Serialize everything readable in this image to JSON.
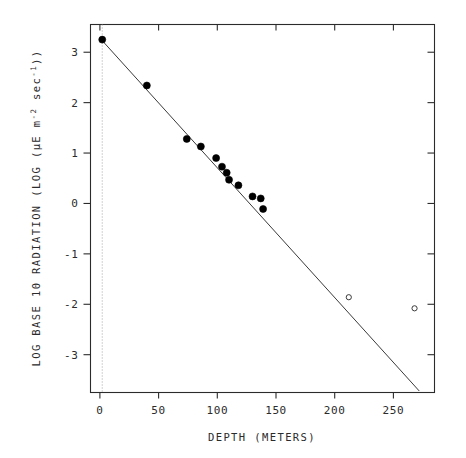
{
  "chart_data": {
    "type": "scatter",
    "title": "",
    "xlabel": "DEPTH (METERS)",
    "ylabel": "LOG BASE 10 RADIATION (LOG (µE m-2 sec-1))",
    "ylabel_parts": {
      "lead": "LOG BASE 10 RADIATION (LOG (",
      "mu": "µE m",
      "exp1": "-2",
      "mid": " sec",
      "exp2": "-1",
      "tail": "))"
    },
    "xlim": [
      -8,
      285
    ],
    "ylim": [
      -3.75,
      3.55
    ],
    "xticks": [
      0,
      50,
      100,
      150,
      200,
      250
    ],
    "xticklabels": [
      "0",
      "50",
      "100",
      "150",
      "200",
      "250"
    ],
    "yticks": [
      3,
      2,
      1,
      0,
      -1,
      -2,
      -3
    ],
    "yticklabels": [
      "3",
      "2",
      "1",
      "0",
      "-1",
      "-2",
      "-3"
    ],
    "grid": false,
    "legend": "none",
    "zero_reference_line": {
      "x": 2,
      "style": "dotted",
      "color": "#9a9a9a"
    },
    "fit_line": {
      "label": "regression line",
      "x_start": 2,
      "y_start": 3.23,
      "x_end": 272,
      "y_end": -3.72,
      "slope": -0.02574,
      "intercept": 3.2815,
      "color": "#3a3a3a"
    },
    "series": [
      {
        "name": "radiation measurements (fitted)",
        "marker": "filled-circle",
        "color": "#000000",
        "points": [
          {
            "x": 2,
            "y": 3.25
          },
          {
            "x": 40,
            "y": 2.34
          },
          {
            "x": 74,
            "y": 1.28
          },
          {
            "x": 86,
            "y": 1.13
          },
          {
            "x": 99,
            "y": 0.9
          },
          {
            "x": 104,
            "y": 0.73
          },
          {
            "x": 108,
            "y": 0.61
          },
          {
            "x": 110,
            "y": 0.47
          },
          {
            "x": 118,
            "y": 0.36
          },
          {
            "x": 130,
            "y": 0.14
          },
          {
            "x": 137,
            "y": 0.1
          },
          {
            "x": 139,
            "y": -0.11
          }
        ]
      },
      {
        "name": "excluded observations",
        "marker": "open-circle",
        "color": "#3a3a3a",
        "points": [
          {
            "x": 212,
            "y": -1.86
          },
          {
            "x": 268,
            "y": -2.08
          }
        ]
      }
    ]
  },
  "figure": {
    "x_axis_label": "DEPTH (METERS)",
    "corner_mark": ""
  }
}
